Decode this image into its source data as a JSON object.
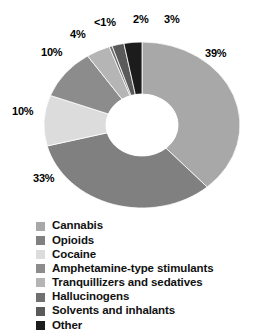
{
  "chart_data": {
    "type": "pie",
    "variant": "donut",
    "title": "",
    "subtitle": "",
    "xlabel": "",
    "ylabel": "",
    "grid": false,
    "legend_position": "bottom",
    "start_angle_deg": 0,
    "direction": "clockwise",
    "units": "percent",
    "categories": [
      "Cannabis",
      "Opioids",
      "Cocaine",
      "Amphetamine-type stimulants",
      "Tranquillizers and sedatives",
      "Hallucinogens",
      "Solvents and inhalants",
      "Other"
    ],
    "values": [
      39,
      33,
      10,
      10,
      4,
      0.5,
      2,
      3
    ],
    "value_labels": [
      "39%",
      "33%",
      "10%",
      "10%",
      "4%",
      "<1%",
      "2%",
      "3%"
    ],
    "colors": [
      "#a8a8a8",
      "#808080",
      "#dcdcdc",
      "#8c8c8c",
      "#b5b5b5",
      "#707070",
      "#5a5a5a",
      "#1c1c1c"
    ],
    "slices": [
      {
        "label": "Cannabis",
        "value": 39,
        "value_label": "39%",
        "color": "#a8a8a8"
      },
      {
        "label": "Opioids",
        "value": 33,
        "value_label": "33%",
        "color": "#808080"
      },
      {
        "label": "Cocaine",
        "value": 10,
        "value_label": "10%",
        "color": "#dcdcdc"
      },
      {
        "label": "Amphetamine-type stimulants",
        "value": 10,
        "value_label": "10%",
        "color": "#8c8c8c"
      },
      {
        "label": "Tranquillizers and sedatives",
        "value": 4,
        "value_label": "4%",
        "color": "#b5b5b5"
      },
      {
        "label": "Hallucinogens",
        "value": 0.5,
        "value_label": "<1%",
        "color": "#707070"
      },
      {
        "label": "Solvents and inhalants",
        "value": 2,
        "value_label": "2%",
        "color": "#5a5a5a"
      },
      {
        "label": "Other",
        "value": 3,
        "value_label": "3%",
        "color": "#1c1c1c"
      }
    ]
  },
  "callouts": [
    {
      "text": "39%",
      "x": 205,
      "y": 47
    },
    {
      "text": "33%",
      "x": 33,
      "y": 172
    },
    {
      "text": "10%",
      "x": 12,
      "y": 105
    },
    {
      "text": "10%",
      "x": 41,
      "y": 46
    },
    {
      "text": "4%",
      "x": 70,
      "y": 28
    },
    {
      "text": "<1%",
      "x": 94,
      "y": 16
    },
    {
      "text": "2%",
      "x": 133,
      "y": 13
    },
    {
      "text": "3%",
      "x": 164,
      "y": 13
    }
  ],
  "legend": {
    "items": [
      {
        "label": "Cannabis",
        "color": "#a8a8a8"
      },
      {
        "label": "Opioids",
        "color": "#808080"
      },
      {
        "label": "Cocaine",
        "color": "#dcdcdc"
      },
      {
        "label": "Amphetamine-type stimulants",
        "color": "#8c8c8c"
      },
      {
        "label": "Tranquillizers and sedatives",
        "color": "#b5b5b5"
      },
      {
        "label": "Hallucinogens",
        "color": "#707070"
      },
      {
        "label": "Solvents and inhalants",
        "color": "#5a5a5a"
      },
      {
        "label": "Other",
        "color": "#1c1c1c"
      }
    ]
  },
  "geometry": {
    "cx": 142,
    "cy": 125,
    "rx": 98,
    "ry": 83,
    "hole_rx": 36,
    "hole_ry": 31,
    "hole_color": "#ffffff",
    "separator_color": "#ffffff"
  }
}
